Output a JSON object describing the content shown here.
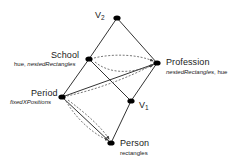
{
  "figure": {
    "type": "node-link-diagram",
    "background_color": "#ffffff",
    "node_color": "#000000",
    "solid_edge_color": "#333333",
    "dashed_edge_color": "#555555"
  },
  "nodes": [
    {
      "id": "v2",
      "label": "V",
      "subscript": "2",
      "annotation": "",
      "x": 117,
      "y": 18,
      "label_x": 95,
      "label_y": 10,
      "annotation_x": 0,
      "annotation_y": 0
    },
    {
      "id": "school",
      "label": "School",
      "subscript": "",
      "annotation": "hue, nestedRectangles",
      "annotation_plain": "hue, ",
      "annotation_italic": "nestedRectangles",
      "x": 89,
      "y": 59,
      "label_x": 51,
      "label_y": 50,
      "annotation_x": 14,
      "annotation_y": 61
    },
    {
      "id": "profession",
      "label": "Profession",
      "subscript": "",
      "annotation": "nestedRectangles, hue",
      "annotation_plain": ", hue",
      "annotation_italic": "nestedRectangles",
      "x": 157,
      "y": 63,
      "label_x": 166,
      "label_y": 57,
      "annotation_x": 166,
      "annotation_y": 69
    },
    {
      "id": "period",
      "label": "Period",
      "subscript": "",
      "annotation": "fixedXPositions",
      "annotation_plain": "",
      "annotation_italic": "fixedXPositions",
      "x": 62,
      "y": 97,
      "label_x": 31,
      "label_y": 88,
      "annotation_x": 10,
      "annotation_y": 99
    },
    {
      "id": "v1",
      "label": "V",
      "subscript": "1",
      "annotation": "",
      "x": 131,
      "y": 101,
      "label_x": 139,
      "label_y": 100,
      "annotation_x": 0,
      "annotation_y": 0
    },
    {
      "id": "person",
      "label": "Person",
      "subscript": "",
      "annotation": "rectangles",
      "annotation_plain": "",
      "annotation_italic": "",
      "annotation_roman": "rectangles",
      "x": 111,
      "y": 143,
      "label_x": 120,
      "label_y": 138,
      "annotation_x": 120,
      "annotation_y": 150
    }
  ],
  "solid_edges": [
    {
      "from": "v2",
      "to": "school",
      "name": "edge-v2-school"
    },
    {
      "from": "v2",
      "to": "profession",
      "name": "edge-v2-profession"
    },
    {
      "from": "school",
      "to": "period",
      "name": "edge-school-period"
    },
    {
      "from": "school",
      "to": "v1",
      "name": "edge-school-v1"
    },
    {
      "from": "period",
      "to": "profession",
      "name": "edge-period-profession"
    },
    {
      "from": "period",
      "to": "person",
      "name": "edge-period-person"
    },
    {
      "from": "v1",
      "to": "person",
      "name": "edge-v1-person"
    },
    {
      "from": "v1",
      "to": "profession",
      "name": "edge-v1-profession"
    }
  ],
  "dashed_edges": [
    {
      "name": "dashed-school-profession-upper",
      "path": "M 94 58 C 115 53, 140 55, 153 61",
      "arrow_at": "profession"
    },
    {
      "name": "dashed-school-profession-lower",
      "path": "M 95 62 C 112 76, 136 72, 153 65",
      "arrow_at": "profession"
    },
    {
      "name": "dashed-period-profession-curve",
      "path": "M 67 96 C 95 90, 128 78, 152 65",
      "arrow_at": "profession"
    },
    {
      "name": "dashed-period-person-outer",
      "path": "M 66 101 C 78 122, 97 136, 108 140",
      "arrow_at": "period"
    },
    {
      "name": "dashed-period-person-inner",
      "path": "M 68 100 C 88 115, 102 128, 109 139",
      "arrow_at": "period"
    }
  ]
}
